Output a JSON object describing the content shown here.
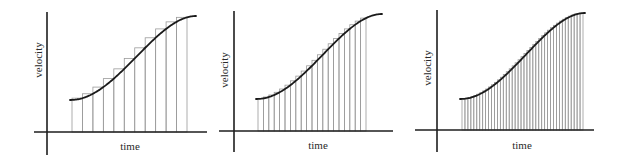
{
  "figure": {
    "colors": {
      "axis": "#1e1e1e",
      "bars": "#9a9a9a",
      "curve": "#1a1a1a",
      "text": "#2a2a2a",
      "background": "#ffffff"
    },
    "panels": [
      {
        "id": "panel-coarse",
        "ylabel": "velocity",
        "xlabel": "time",
        "rectangles": 11,
        "y_axis": {
          "x": 47,
          "y1": 12,
          "y2": 155
        },
        "x_axis": {
          "y": 132,
          "x1": 34,
          "x2": 207
        },
        "curve": {
          "x_start": 70,
          "y_start": 100,
          "x_end": 196,
          "y_end": 16,
          "flat_until": 81
        },
        "bars": {
          "x_start": 72,
          "x_end": 187
        },
        "ylabel_pos": {
          "x": 38,
          "y": 60
        },
        "xlabel_pos": {
          "x": 130,
          "y": 150
        }
      },
      {
        "id": "panel-medium",
        "ylabel": "velocity",
        "xlabel": "time",
        "rectangles": 20,
        "y_axis": {
          "x": 234,
          "y1": 11,
          "y2": 152
        },
        "x_axis": {
          "y": 131,
          "x1": 219,
          "x2": 393
        },
        "curve": {
          "x_start": 256,
          "y_start": 99,
          "x_end": 382,
          "y_end": 14,
          "flat_until": 266
        },
        "bars": {
          "x_start": 258,
          "x_end": 366
        },
        "ylabel_pos": {
          "x": 224,
          "y": 70
        },
        "xlabel_pos": {
          "x": 318,
          "y": 149
        }
      },
      {
        "id": "panel-fine",
        "ylabel": "velocity",
        "xlabel": "time",
        "rectangles": 41,
        "y_axis": {
          "x": 437,
          "y1": 10,
          "y2": 152
        },
        "x_axis": {
          "y": 130,
          "x1": 415,
          "x2": 594
        },
        "curve": {
          "x_start": 460,
          "y_start": 99,
          "x_end": 585,
          "y_end": 13,
          "flat_until": 470
        },
        "bars": {
          "x_start": 462,
          "x_end": 583
        },
        "ylabel_pos": {
          "x": 427,
          "y": 68
        },
        "xlabel_pos": {
          "x": 522,
          "y": 149
        }
      }
    ]
  }
}
